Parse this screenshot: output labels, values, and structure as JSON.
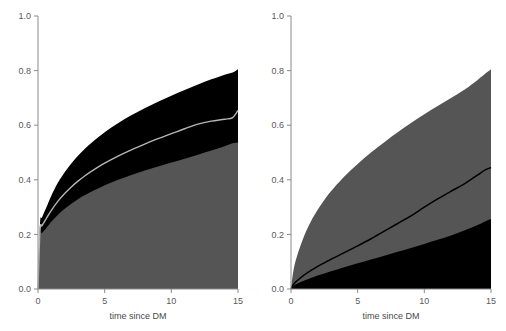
{
  "figure": {
    "type": "stacked-area-pair",
    "background": "#ffffff",
    "panel_count": 2
  },
  "colors": {
    "gray_band": "#555555",
    "black_band": "#000000",
    "line_light": "#b5b5b5",
    "line_dark": "#000000",
    "axis": "#8a8a8a",
    "text": "#4a4a4a"
  },
  "axes": {
    "x": {
      "label": "time since DM",
      "ticks": [
        0,
        5,
        10,
        15
      ],
      "tick_labels": [
        "0",
        "5",
        "10",
        "15"
      ],
      "min": 0,
      "max": 15
    },
    "y": {
      "label": "",
      "ticks": [
        0.0,
        0.2,
        0.4,
        0.6,
        0.8,
        1.0
      ],
      "tick_labels": [
        "0.0",
        "0.2",
        "0.4",
        "0.6",
        "0.8",
        "1.0"
      ],
      "min": 0,
      "max": 1
    }
  },
  "chart_data": [
    {
      "type": "area",
      "panel": "left",
      "title": "",
      "xlabel": "time since DM",
      "ylabel": "",
      "xlim": [
        0,
        15
      ],
      "ylim": [
        0,
        1
      ],
      "grid": false,
      "legend": "none",
      "x": [
        0,
        0.15,
        0.3,
        0.6,
        1,
        1.5,
        2,
        2.5,
        3,
        3.5,
        4,
        5,
        6,
        7,
        8,
        9,
        10,
        11,
        12,
        13,
        14,
        14.6,
        15
      ],
      "series": [
        {
          "name": "lower-gray-cumulative",
          "color": "#555555",
          "values": [
            0.0,
            0.19,
            0.205,
            0.222,
            0.246,
            0.272,
            0.294,
            0.312,
            0.329,
            0.343,
            0.356,
            0.38,
            0.4,
            0.418,
            0.434,
            0.449,
            0.463,
            0.477,
            0.492,
            0.507,
            0.523,
            0.534,
            0.536
          ]
        },
        {
          "name": "mid-line-cumulative",
          "color": "#b5b5b5",
          "values": [
            0.0,
            0.215,
            0.232,
            0.256,
            0.288,
            0.322,
            0.35,
            0.374,
            0.395,
            0.414,
            0.431,
            0.461,
            0.487,
            0.51,
            0.531,
            0.551,
            0.569,
            0.587,
            0.604,
            0.615,
            0.622,
            0.628,
            0.654
          ]
        },
        {
          "name": "upper-black-cumulative",
          "color": "#000000",
          "values": [
            0.0,
            0.238,
            0.262,
            0.296,
            0.342,
            0.39,
            0.428,
            0.46,
            0.488,
            0.513,
            0.535,
            0.574,
            0.607,
            0.636,
            0.662,
            0.686,
            0.708,
            0.729,
            0.749,
            0.768,
            0.785,
            0.793,
            0.805
          ]
        }
      ]
    },
    {
      "type": "area",
      "panel": "right",
      "title": "",
      "xlabel": "time since DM",
      "ylabel": "",
      "xlim": [
        0,
        15
      ],
      "ylim": [
        0,
        1
      ],
      "grid": false,
      "legend": "none",
      "x": [
        0,
        0.2,
        0.5,
        1,
        1.5,
        2,
        2.5,
        3,
        4,
        5,
        6,
        7,
        8,
        9,
        10,
        11,
        12,
        13,
        14,
        14.6,
        15
      ],
      "series": [
        {
          "name": "lower-black-cumulative",
          "color": "#000000",
          "values": [
            0.0,
            0.012,
            0.02,
            0.031,
            0.04,
            0.049,
            0.057,
            0.065,
            0.08,
            0.094,
            0.108,
            0.122,
            0.136,
            0.15,
            0.165,
            0.18,
            0.196,
            0.214,
            0.234,
            0.248,
            0.256
          ]
        },
        {
          "name": "mid-line-cumulative",
          "color": "#000000",
          "values": [
            0.0,
            0.018,
            0.032,
            0.052,
            0.068,
            0.083,
            0.096,
            0.109,
            0.133,
            0.158,
            0.184,
            0.212,
            0.24,
            0.268,
            0.3,
            0.33,
            0.358,
            0.385,
            0.418,
            0.437,
            0.445
          ]
        },
        {
          "name": "upper-gray-cumulative",
          "color": "#555555",
          "values": [
            0.0,
            0.072,
            0.128,
            0.196,
            0.248,
            0.29,
            0.326,
            0.358,
            0.412,
            0.458,
            0.5,
            0.538,
            0.574,
            0.608,
            0.64,
            0.67,
            0.7,
            0.73,
            0.766,
            0.79,
            0.805
          ]
        }
      ]
    }
  ],
  "panels": [
    {
      "name": "left-panel",
      "xlabel": "time since DM"
    },
    {
      "name": "right-panel",
      "xlabel": "time since DM"
    }
  ]
}
